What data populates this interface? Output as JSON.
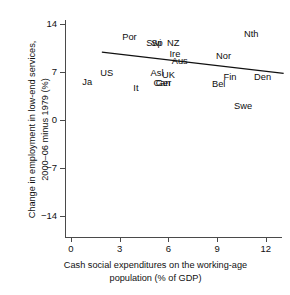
{
  "chart_data": {
    "type": "scatter",
    "title": "",
    "xlabel": "Cash social expenditures on the working-age\npopulation (% of GDP)",
    "ylabel": "Change in employment in low-end services,\n2000–06 minus 1979 (%)",
    "xlim": [
      0,
      12.5
    ],
    "ylim": [
      -14,
      14
    ],
    "xticks": [
      0,
      3,
      6,
      9,
      12
    ],
    "xticklabels": [
      "0",
      "3",
      "6",
      "9",
      "12"
    ],
    "yticks": [
      -14,
      -7,
      0,
      7,
      14
    ],
    "yticklabels": [
      "−14",
      "−7",
      "0",
      "7",
      "14"
    ],
    "grid": false,
    "legend": "none",
    "marker_style": "text-labels-only",
    "points": [
      {
        "label": "Por",
        "x": 3.6,
        "y": 12.1
      },
      {
        "label": "Swi",
        "x": 5.1,
        "y": 11.2
      },
      {
        "label": "Sp",
        "x": 5.3,
        "y": 11.2
      },
      {
        "label": "NZ",
        "x": 6.3,
        "y": 11.3
      },
      {
        "label": "Nth",
        "x": 11.1,
        "y": 12.6
      },
      {
        "label": "Ire",
        "x": 6.4,
        "y": 9.6
      },
      {
        "label": "Nor",
        "x": 9.4,
        "y": 9.3
      },
      {
        "label": "Aus",
        "x": 6.7,
        "y": 8.6
      },
      {
        "label": "US",
        "x": 2.2,
        "y": 6.9
      },
      {
        "label": "Asl",
        "x": 5.3,
        "y": 6.8
      },
      {
        "label": "UK",
        "x": 6.0,
        "y": 6.5
      },
      {
        "label": "Ja",
        "x": 1.0,
        "y": 5.6
      },
      {
        "label": "Can",
        "x": 5.6,
        "y": 5.4
      },
      {
        "label": "Ger",
        "x": 5.7,
        "y": 5.4
      },
      {
        "label": "It",
        "x": 4.0,
        "y": 4.7
      },
      {
        "label": "Bel",
        "x": 9.1,
        "y": 5.3
      },
      {
        "label": "Fin",
        "x": 9.8,
        "y": 6.3
      },
      {
        "label": "Den",
        "x": 11.8,
        "y": 6.2
      },
      {
        "label": "Swe",
        "x": 10.6,
        "y": 2.1
      }
    ],
    "trendline": {
      "type": "linear-fit",
      "x_start": 1.9,
      "y_start": 9.9,
      "x_end": 13.1,
      "y_end": 6.8,
      "color": "#111111"
    },
    "axis_color": "#4a4a4a",
    "text_color": "#111111",
    "background": "#ffffff"
  }
}
